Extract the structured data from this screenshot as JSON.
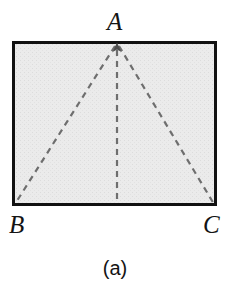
{
  "figure": {
    "caption": "(a)",
    "shape_name": "rectangle-with-isosceles-triangle",
    "labels": {
      "apex": "A",
      "bottom_left": "B",
      "bottom_right": "C"
    },
    "colors": {
      "outline": "#111111",
      "fill": "#e9e9e9",
      "dashed_line": "#6e6e6e",
      "background": "#ffffff",
      "text": "#141414"
    },
    "rectangle": {
      "x": 12,
      "y": 41,
      "width": 205,
      "height": 165,
      "stroke_width": 3
    },
    "dashed": {
      "dash_length": 6,
      "gap_length": 5,
      "stroke_width": 2
    },
    "points": {
      "A": {
        "x": 117,
        "y": 43
      },
      "B": {
        "x": 14,
        "y": 204
      },
      "C": {
        "x": 215,
        "y": 204
      },
      "M": {
        "x": 117,
        "y": 204
      }
    },
    "segments": [
      {
        "name": "median-AM",
        "from": "A",
        "to": "M",
        "style": "dashed"
      },
      {
        "name": "side-AB",
        "from": "A",
        "to": "B",
        "style": "dashed"
      },
      {
        "name": "side-AC",
        "from": "A",
        "to": "C",
        "style": "dashed"
      }
    ],
    "arrowhead": {
      "at": "A",
      "direction": "up",
      "size": 7
    }
  }
}
